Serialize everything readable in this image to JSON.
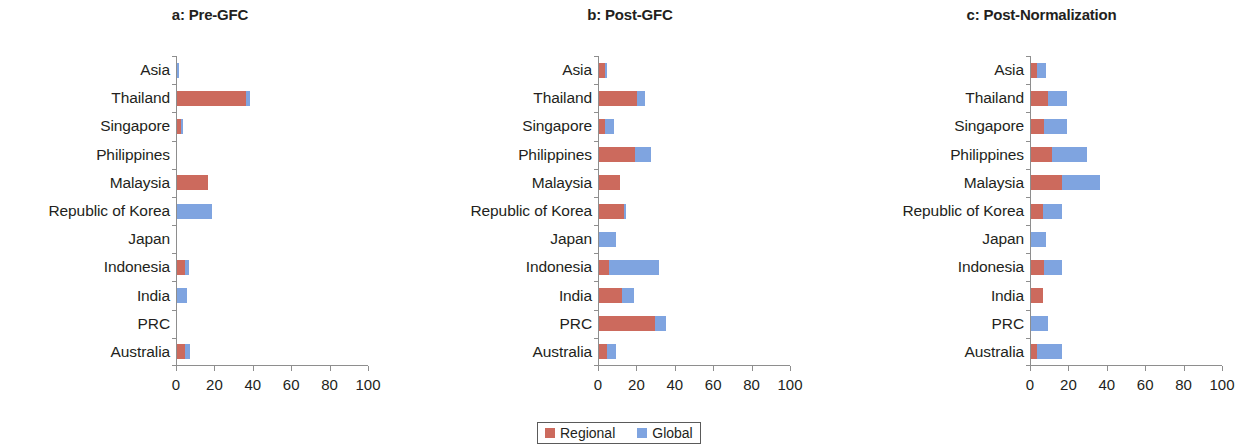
{
  "figure": {
    "background": "#ffffff",
    "width": 1243,
    "height": 447
  },
  "legend": {
    "position": "bottom-center",
    "entries": [
      {
        "label": "Regional",
        "color": "#cc6a5d"
      },
      {
        "label": "Global",
        "color": "#7fa4e0"
      }
    ]
  },
  "colors": {
    "regional": "#cc6a5d",
    "global": "#7fa4e0",
    "axis": "#8e8e8e",
    "text": "#231f20"
  },
  "axis": {
    "ticks": [
      0,
      20,
      40,
      60,
      80,
      100
    ],
    "tick_labels": [
      "0",
      "20",
      "40",
      "60",
      "80",
      "100"
    ],
    "xlim": [
      0,
      100
    ]
  },
  "categories": [
    "Asia",
    "Thailand",
    "Singapore",
    "Philippines",
    "Malaysia",
    "Republic of Korea",
    "Japan",
    "Indonesia",
    "India",
    "PRC",
    "Australia"
  ],
  "chart_data": [
    {
      "type": "bar",
      "orientation": "horizontal",
      "stacked": true,
      "panel": "a",
      "title": "a: Pre-GFC",
      "xlabel": "",
      "ylabel": "",
      "xlim": [
        0,
        100
      ],
      "xticks": [
        0,
        20,
        40,
        60,
        80,
        100
      ],
      "grid": false,
      "legend": [
        "Regional",
        "Global"
      ],
      "categories": [
        "Asia",
        "Thailand",
        "Singapore",
        "Philippines",
        "Malaysia",
        "Republic of Korea",
        "Japan",
        "Indonesia",
        "India",
        "PRC",
        "Australia"
      ],
      "series": [
        {
          "name": "Regional",
          "color": "#cc6a5d",
          "values": [
            0,
            36,
            2,
            0,
            16,
            0,
            0,
            4,
            0,
            0,
            4
          ]
        },
        {
          "name": "Global",
          "color": "#7fa4e0",
          "values": [
            1,
            2,
            1,
            0,
            0,
            18,
            0,
            2,
            5,
            0,
            3
          ]
        }
      ]
    },
    {
      "type": "bar",
      "orientation": "horizontal",
      "stacked": true,
      "panel": "b",
      "title": "b: Post-GFC",
      "xlabel": "",
      "ylabel": "",
      "xlim": [
        0,
        100
      ],
      "xticks": [
        0,
        20,
        40,
        60,
        80,
        100
      ],
      "grid": false,
      "legend": [
        "Regional",
        "Global"
      ],
      "categories": [
        "Asia",
        "Thailand",
        "Singapore",
        "Philippines",
        "Malaysia",
        "Republic of Korea",
        "Japan",
        "Indonesia",
        "India",
        "PRC",
        "Australia"
      ],
      "series": [
        {
          "name": "Regional",
          "color": "#cc6a5d",
          "values": [
            3,
            20,
            3,
            19,
            11,
            13,
            0,
            5,
            12,
            29,
            4
          ]
        },
        {
          "name": "Global",
          "color": "#7fa4e0",
          "values": [
            1,
            4,
            5,
            8,
            0,
            1,
            9,
            26,
            6,
            6,
            5
          ]
        }
      ]
    },
    {
      "type": "bar",
      "orientation": "horizontal",
      "stacked": true,
      "panel": "c",
      "title": "c: Post-Normalization",
      "xlabel": "",
      "ylabel": "",
      "xlim": [
        0,
        100
      ],
      "xticks": [
        0,
        20,
        40,
        60,
        80,
        100
      ],
      "grid": false,
      "legend": [
        "Regional",
        "Global"
      ],
      "categories": [
        "Asia",
        "Thailand",
        "Singapore",
        "Philippines",
        "Malaysia",
        "Republic of Korea",
        "Japan",
        "Indonesia",
        "India",
        "PRC",
        "Australia"
      ],
      "series": [
        {
          "name": "Regional",
          "color": "#cc6a5d",
          "values": [
            3,
            9,
            7,
            11,
            16,
            6,
            0,
            7,
            6,
            0,
            3
          ]
        },
        {
          "name": "Global",
          "color": "#7fa4e0",
          "values": [
            5,
            10,
            12,
            18,
            20,
            10,
            8,
            9,
            0,
            9,
            13
          ]
        }
      ]
    }
  ]
}
